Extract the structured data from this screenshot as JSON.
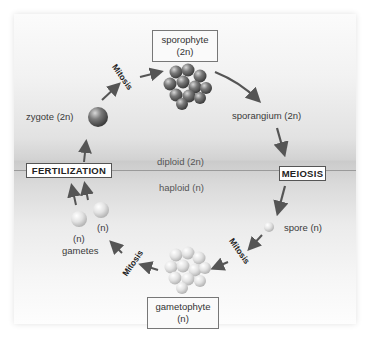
{
  "diagram": {
    "type": "plant life cycle (alternation of generations)",
    "zones": {
      "upper": "diploid (2n)",
      "lower": "haploid (n)"
    },
    "stages": {
      "fertilization": "FERTILIZATION",
      "meiosis": "MEIOSIS"
    },
    "boxes": {
      "sporophyte": {
        "line1": "sporophyte",
        "line2": "(2n)"
      },
      "gametophyte": {
        "line1": "gametophyte",
        "line2": "(n)"
      }
    },
    "labels": {
      "zygote": "zygote (2n)",
      "sporangium": "sporangium (2n)",
      "spore": "spore (n)",
      "gamete_n1": "(n)",
      "gamete_n2": "(n)",
      "gametes": "gametes"
    },
    "processes": {
      "mitosis_top": "Mitosis",
      "mitosis_right": "Mitosis",
      "mitosis_left": "Mitosis"
    },
    "colors": {
      "diploid_cell": "#6e6e6e",
      "haploid_cell": "#e4e4e4",
      "arrow": "#555555",
      "divider": "#9a9a9a"
    }
  }
}
